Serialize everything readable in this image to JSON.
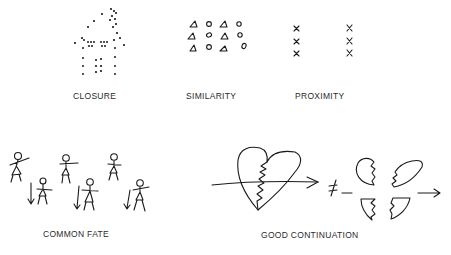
{
  "panels": [
    {
      "id": "closure",
      "label": "CLOSURE",
      "figure": "house outline made of scattered dots"
    },
    {
      "id": "similarity",
      "label": "SIMILARITY",
      "figure": "grid of alternating triangles and circles, 3 rows x 4 columns",
      "grid": [
        [
          "triangle",
          "circle",
          "triangle",
          "circle"
        ],
        [
          "triangle",
          "circle",
          "triangle",
          "circle"
        ],
        [
          "triangle",
          "circle",
          "triangle",
          "circle"
        ]
      ]
    },
    {
      "id": "proximity",
      "label": "PROXIMITY",
      "figure": "two columns of three x marks each",
      "marks": "x"
    },
    {
      "id": "common-fate",
      "label": "COMMON FATE",
      "figure": "six stick figures; three lower ones with downward arrows"
    },
    {
      "id": "good-continuation",
      "label": "GOOD CONTINUATION",
      "figure": "heart crossed by arrow",
      "relation": "≠",
      "note": "heart split into four jagged pieces with arrow"
    }
  ],
  "colors": {
    "ink": "#1a1a1a",
    "background": "#ffffff",
    "label": "#2a2a2a"
  }
}
